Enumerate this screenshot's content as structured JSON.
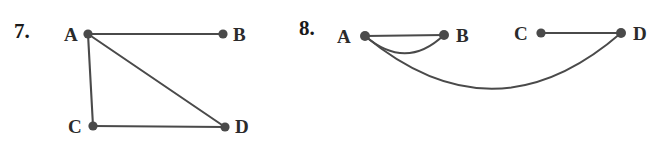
{
  "figure": {
    "background_color": "#ffffff",
    "ink_color": "#4a4a4a",
    "label_color": "#2b2b2b"
  },
  "problems": [
    {
      "number_label": "7.",
      "number_pos": {
        "x": 14,
        "y": 21
      },
      "vertices": [
        {
          "id": "A",
          "label": "A",
          "cx": 88,
          "cy": 34,
          "r": 4.6,
          "label_x": 64,
          "label_y": 25
        },
        {
          "id": "B",
          "label": "B",
          "cx": 223,
          "cy": 34,
          "r": 4.6,
          "label_x": 233,
          "label_y": 25
        },
        {
          "id": "C",
          "label": "C",
          "cx": 93,
          "cy": 126,
          "r": 4.6,
          "label_x": 68,
          "label_y": 117
        },
        {
          "id": "D",
          "label": "D",
          "cx": 225,
          "cy": 127,
          "r": 4.6,
          "label_x": 235,
          "label_y": 117
        }
      ],
      "edges": [
        {
          "from": "A",
          "to": "B",
          "kind": "straight"
        },
        {
          "from": "A",
          "to": "C",
          "kind": "straight"
        },
        {
          "from": "A",
          "to": "D",
          "kind": "straight"
        },
        {
          "from": "C",
          "to": "D",
          "kind": "straight"
        }
      ]
    },
    {
      "number_label": "8.",
      "number_pos": {
        "x": 299,
        "y": 18
      },
      "vertices": [
        {
          "id": "A",
          "label": "A",
          "cx": 365,
          "cy": 36,
          "r": 5.0,
          "label_x": 337,
          "label_y": 27
        },
        {
          "id": "B",
          "label": "B",
          "cx": 444,
          "cy": 35,
          "r": 5.0,
          "label_x": 456,
          "label_y": 26
        },
        {
          "id": "C",
          "label": "C",
          "cx": 541,
          "cy": 33,
          "r": 4.6,
          "label_x": 514,
          "label_y": 24
        },
        {
          "id": "D",
          "label": "D",
          "cx": 621,
          "cy": 33,
          "r": 5.0,
          "label_x": 633,
          "label_y": 24
        }
      ],
      "edges": [
        {
          "from": "A",
          "to": "B",
          "kind": "straight"
        },
        {
          "from": "A",
          "to": "B",
          "kind": "arc",
          "sag": 18
        },
        {
          "from": "C",
          "to": "D",
          "kind": "straight"
        },
        {
          "from": "A",
          "to": "D",
          "kind": "arc",
          "sag": 74
        }
      ]
    }
  ]
}
